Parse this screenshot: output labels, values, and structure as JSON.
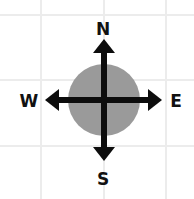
{
  "diagram": {
    "type": "compass-rose",
    "colors": {
      "background": "#ffffff",
      "grid": "#ececec",
      "circle": "#9a9a9a",
      "arrows": "#0d0d0d",
      "labels": "#111111"
    },
    "labels": {
      "north": "N",
      "east": "E",
      "south": "S",
      "west": "W"
    }
  }
}
